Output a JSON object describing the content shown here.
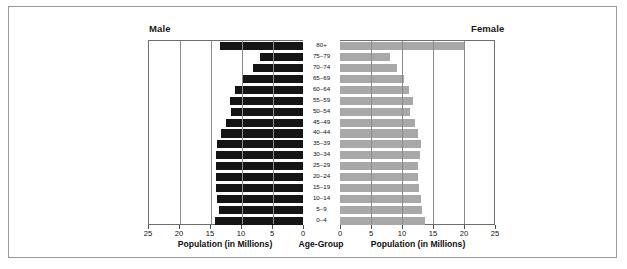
{
  "headings": {
    "male": "Male",
    "female": "Female"
  },
  "axis_titles": {
    "male": "Population (in Millions)",
    "center": "Age-Group",
    "female": "Population (in Millions)"
  },
  "colors": {
    "male_bar": "#151515",
    "female_bar": "#a8a8a8",
    "frame": "#9a9a9a",
    "axis": "#6e6e6e",
    "gridline": "#8c8c8c",
    "text": "#111111",
    "background": "#ffffff"
  },
  "chart_data": {
    "type": "bar",
    "title": "",
    "subtitle": "",
    "orientation": "horizontal",
    "layout": "population-pyramid",
    "xlabel": "Population (in Millions)",
    "ylabel": "Age-Group",
    "xlim": [
      0,
      25
    ],
    "xticks": [
      0,
      5,
      10,
      15,
      20,
      25
    ],
    "male_xticks_order": [
      25,
      20,
      15,
      10,
      5,
      0
    ],
    "female_xticks_order": [
      0,
      5,
      10,
      15,
      20,
      25
    ],
    "grid": true,
    "grid_axis": "x",
    "legend": "top-corners",
    "categories": [
      "80+",
      "75–79",
      "70–74",
      "65–69",
      "60–64",
      "55–59",
      "50–54",
      "45–49",
      "40–44",
      "35–39",
      "30–34",
      "25–29",
      "20–24",
      "15–19",
      "10–14",
      "5–9",
      "0–4"
    ],
    "series": [
      {
        "name": "Male",
        "side": "left",
        "color": "#151515",
        "values": [
          13.4,
          6.9,
          8.1,
          9.6,
          11.0,
          11.8,
          11.6,
          12.4,
          13.2,
          13.9,
          14.0,
          14.0,
          14.1,
          14.1,
          13.9,
          13.5,
          14.2
        ]
      },
      {
        "name": "Female",
        "side": "right",
        "color": "#a8a8a8",
        "values": [
          20.2,
          8.0,
          9.2,
          10.4,
          11.2,
          11.7,
          11.3,
          12.1,
          12.6,
          13.0,
          12.9,
          12.5,
          12.6,
          12.8,
          13.0,
          13.3,
          13.7
        ]
      }
    ]
  }
}
